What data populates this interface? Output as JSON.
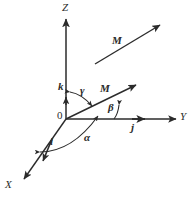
{
  "figure": {
    "stroke_color": "#2b2b2b",
    "background": "#ffffff"
  },
  "axes": [
    {
      "name": "z-axis",
      "label": "Z",
      "from": [
        66,
        119
      ],
      "to": [
        66,
        18
      ],
      "label_pos": [
        63,
        4
      ]
    },
    {
      "name": "y-axis",
      "label": "Y",
      "from": [
        66,
        119
      ],
      "to": [
        177,
        119
      ],
      "label_pos": [
        181,
        112
      ]
    },
    {
      "name": "x-axis",
      "label": "X",
      "from": [
        66,
        119
      ],
      "to": [
        23,
        180
      ],
      "label_pos": [
        5,
        180
      ]
    }
  ],
  "unit_vectors": [
    {
      "name": "k-unit-vector",
      "label": "k",
      "tip": [
        66,
        98
      ],
      "label_pos": [
        58,
        82
      ]
    },
    {
      "name": "j-unit-vector",
      "label": "j",
      "tip": [
        146,
        119
      ],
      "label_pos": [
        131,
        122
      ]
    },
    {
      "name": "i-unit-vector",
      "label": "i",
      "tip": [
        42,
        162
      ],
      "label_pos": [
        50,
        137
      ]
    }
  ],
  "vectors": [
    {
      "name": "m-vector-at-origin",
      "label": "M",
      "from": [
        66,
        119
      ],
      "to": [
        138,
        84
      ],
      "label_pos": [
        100,
        84
      ]
    },
    {
      "name": "m-vector-free",
      "label": "M",
      "from": [
        95,
        64
      ],
      "to": [
        162,
        24
      ],
      "label_pos": [
        113,
        36
      ]
    }
  ],
  "angles": [
    {
      "name": "gamma-angle",
      "symbol": "γ",
      "between": [
        "z-axis",
        "m-vector"
      ],
      "label_pos": [
        80,
        86
      ]
    },
    {
      "name": "beta-angle",
      "symbol": "β",
      "between": [
        "y-axis",
        "m-vector"
      ],
      "label_pos": [
        108,
        103
      ]
    },
    {
      "name": "alpha-angle",
      "symbol": "α",
      "between": [
        "x-axis",
        "m-projection"
      ],
      "label_pos": [
        84,
        133
      ]
    }
  ],
  "origin": {
    "name": "origin-label",
    "label": "0",
    "label_pos": [
      57,
      111
    ]
  }
}
